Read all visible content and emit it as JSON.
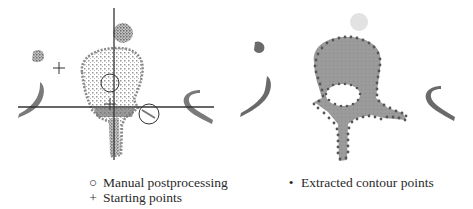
{
  "figure": {
    "left_panel": {
      "description": "Segmentation input with starting points, crosshair lines and manual postprocessing circles",
      "colors": {
        "bone": "#8a8a8a",
        "lines": "#333333"
      }
    },
    "right_panel": {
      "description": "Segmented vertebra region with extracted contour points",
      "colors": {
        "fill": "#9a9a9a",
        "contour_points": "#555555"
      }
    }
  },
  "legend": {
    "left": [
      {
        "symbol": "○",
        "icon": "circle-icon",
        "label": "Manual postprocessing"
      },
      {
        "symbol": "+",
        "icon": "plus-icon",
        "label": "Starting points"
      }
    ],
    "right": [
      {
        "symbol": "•",
        "icon": "dot-icon",
        "label": "Extracted contour points"
      }
    ]
  }
}
